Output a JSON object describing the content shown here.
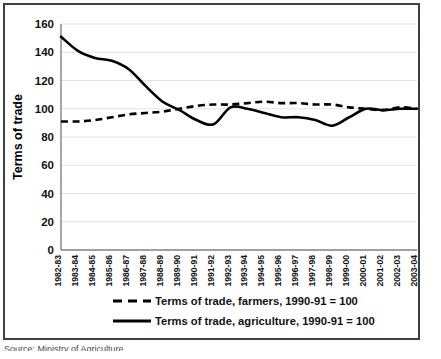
{
  "chart_data": {
    "type": "line",
    "title": "",
    "xlabel": "",
    "ylabel": "Terms of trade",
    "ylim": [
      0,
      160
    ],
    "ytick_step": 20,
    "yticks": [
      160,
      140,
      120,
      100,
      80,
      60,
      40,
      20,
      0
    ],
    "grid": true,
    "legend_position": "bottom",
    "categories": [
      "1982-83",
      "1983-84",
      "1984-85",
      "1985-86",
      "1986-87",
      "1987-88",
      "1988-89",
      "1989-90",
      "1990-91",
      "1991-92",
      "1992-93",
      "1993-94",
      "1994-95",
      "1995-96",
      "1996-97",
      "1997-98",
      "1998-99",
      "1999-00",
      "2000-01",
      "2001-02",
      "2002-03",
      "2003-04"
    ],
    "series": [
      {
        "name": "Terms of trade, farmers, 1990-91 = 100",
        "style": "dashed",
        "color": "#000000",
        "values": [
          91,
          91,
          92,
          94,
          96,
          97,
          98,
          100,
          102,
          103,
          103,
          104,
          105,
          104,
          104,
          103,
          103,
          101,
          100,
          99,
          101,
          100
        ]
      },
      {
        "name": "Terms of trade, agriculture, 1990-91 = 100",
        "style": "solid",
        "color": "#000000",
        "values": [
          151,
          141,
          136,
          134,
          128,
          116,
          105,
          99,
          92,
          89,
          101,
          100,
          97,
          94,
          94,
          92,
          88,
          94,
          100,
          99,
          100,
          100
        ]
      }
    ]
  },
  "legend": {
    "items": [
      {
        "label": "Terms of trade, farmers, 1990-91 = 100",
        "style": "dashed"
      },
      {
        "label": "Terms of trade, agriculture, 1990-91 = 100",
        "style": "solid"
      }
    ]
  },
  "source_note": "Source: Ministry of Agriculture"
}
